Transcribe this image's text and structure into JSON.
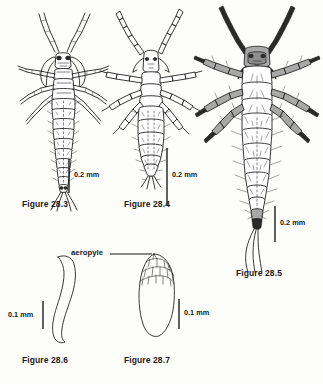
{
  "plate": {
    "title": "Insect larvae and egg morphology plate",
    "background_color": "#fdfdfb",
    "ink_color": "#171717"
  },
  "figures": [
    {
      "id": "28.3",
      "caption": "Figure 28.3",
      "subject": "slender campodeiform larva, dorsal view",
      "scale": {
        "label": "0.2 mm",
        "value": 0.2,
        "unit": "mm"
      }
    },
    {
      "id": "28.4",
      "caption": "Figure 28.4",
      "subject": "stout larva with beaded segmented legs, dorsal view",
      "scale": {
        "label": "0.2 mm",
        "value": 0.2,
        "unit": "mm"
      }
    },
    {
      "id": "28.5",
      "caption": "Figure 28.5",
      "subject": "large setose larva with shaded head and caudal filaments, dorsal view",
      "scale": {
        "label": "0.2 mm",
        "value": 0.2,
        "unit": "mm"
      }
    },
    {
      "id": "28.6",
      "caption": "Figure 28.6",
      "subject": "curved elongate egg outline",
      "scale": {
        "label": "0.1 mm",
        "value": 0.1,
        "unit": "mm"
      }
    },
    {
      "id": "28.7",
      "caption": "Figure 28.7",
      "subject": "oval egg with reticulate aeropyle cap",
      "scale": {
        "label": "0.1 mm",
        "value": 0.1,
        "unit": "mm"
      },
      "annotation": {
        "label": "aeropyle",
        "leader": true
      }
    }
  ],
  "annotations": {
    "aeropyle": "aeropyle"
  },
  "scale_bars": {
    "two_tenths": "0.2 mm",
    "one_tenth": "0.1 mm"
  }
}
